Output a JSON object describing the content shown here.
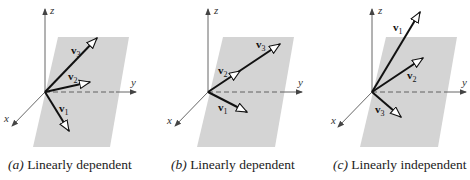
{
  "figure": {
    "colors": {
      "plane": "#d4d4d4",
      "axis": "#555555",
      "vector": "#111111",
      "text": "#222222"
    },
    "axis_labels": {
      "x": "x",
      "y": "y",
      "z": "z"
    },
    "vector_symbol": "v",
    "panels": [
      {
        "id": "a",
        "caption_tag": "(a)",
        "caption_text": "Linearly dependent",
        "vectors": [
          {
            "name": "v",
            "sub": "1",
            "in_plane": true
          },
          {
            "name": "v",
            "sub": "2",
            "in_plane": true
          },
          {
            "name": "v",
            "sub": "3",
            "in_plane": true
          }
        ]
      },
      {
        "id": "b",
        "caption_tag": "(b)",
        "caption_text": "Linearly dependent",
        "vectors": [
          {
            "name": "v",
            "sub": "1",
            "in_plane": true
          },
          {
            "name": "v",
            "sub": "2",
            "in_plane": true
          },
          {
            "name": "v",
            "sub": "3",
            "in_plane": true
          }
        ]
      },
      {
        "id": "c",
        "caption_tag": "(c)",
        "caption_text": "Linearly independent",
        "vectors": [
          {
            "name": "v",
            "sub": "1",
            "in_plane": false
          },
          {
            "name": "v",
            "sub": "2",
            "in_plane": true
          },
          {
            "name": "v",
            "sub": "3",
            "in_plane": true
          }
        ]
      }
    ]
  }
}
